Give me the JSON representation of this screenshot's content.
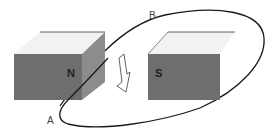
{
  "diagram": {
    "magnets": [
      {
        "id": "north",
        "label": "N"
      },
      {
        "id": "south",
        "label": "S"
      }
    ],
    "loop": {
      "point_labels": [
        "A",
        "B"
      ]
    },
    "arrow": {
      "direction": "down",
      "icon": "hollow-arrow-down"
    },
    "colors": {
      "front_face": "#6e6e6e",
      "side_face": "#8c8c8c",
      "top_face": "#f2f2f2",
      "edge": "#3a3a3a",
      "loop": "#1a1a1a",
      "label_on_magnet": "#1e1e1e",
      "point_label": "#444444"
    }
  }
}
